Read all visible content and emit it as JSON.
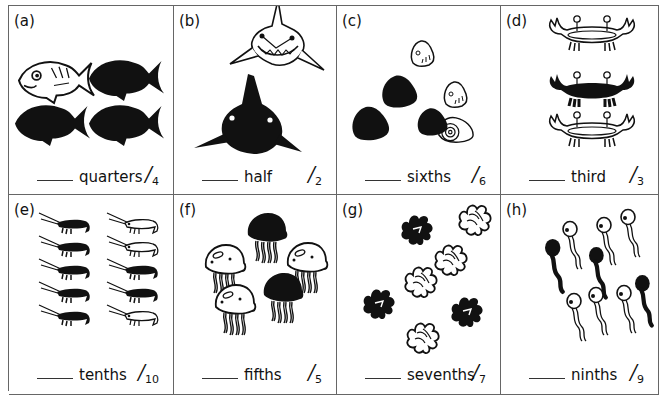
{
  "worksheet": {
    "cells": [
      {
        "label": "(a)",
        "word": "quarters",
        "numerator_mark": "/",
        "denominator": "4",
        "shaded": 3,
        "total": 4,
        "creature": "fish"
      },
      {
        "label": "(b)",
        "word": "half",
        "numerator_mark": "/",
        "denominator": "2",
        "shaded": 1,
        "total": 2,
        "creature": "shark"
      },
      {
        "label": "(c)",
        "word": "sixths",
        "numerator_mark": "/",
        "denominator": "6",
        "shaded": 3,
        "total": 6,
        "creature": "shell"
      },
      {
        "label": "(d)",
        "word": "third",
        "numerator_mark": "/",
        "denominator": "3",
        "shaded": 1,
        "total": 3,
        "creature": "crab"
      },
      {
        "label": "(e)",
        "word": "tenths",
        "numerator_mark": "/",
        "denominator": "10",
        "shaded": 7,
        "total": 10,
        "creature": "shrimp"
      },
      {
        "label": "(f)",
        "word": "fifths",
        "numerator_mark": "/",
        "denominator": "5",
        "shaded": 2,
        "total": 5,
        "creature": "jellyfish"
      },
      {
        "label": "(g)",
        "word": "sevenths",
        "numerator_mark": "/",
        "denominator": "7",
        "shaded": 3,
        "total": 7,
        "creature": "seaweed"
      },
      {
        "label": "(h)",
        "word": "ninths",
        "numerator_mark": "/",
        "denominator": "9",
        "shaded": 3,
        "total": 9,
        "creature": "tadpole"
      }
    ]
  },
  "colors": {
    "ink": "#111111",
    "border": "#666666",
    "paper": "#ffffff"
  }
}
